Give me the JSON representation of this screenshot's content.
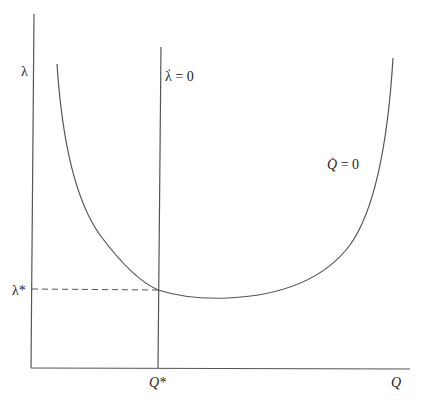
{
  "diagram": {
    "type": "phase-diagram",
    "axes": {
      "y_label": "λ",
      "x_label": "Q"
    },
    "curves": [
      {
        "id": "lambda-dot-zero",
        "shape": "vertical-line",
        "label_symbol": "λ",
        "label_rest": " = 0",
        "dot": "·"
      },
      {
        "id": "q-dot-zero",
        "shape": "u-curve",
        "label_symbol": "Q",
        "label_rest": " = 0",
        "dot": "·"
      }
    ],
    "equilibrium": {
      "lambda_label": "λ*",
      "q_label": "Q*"
    },
    "colors": {
      "line": "#555555",
      "text": "#222222",
      "background": "#ffffff"
    }
  }
}
